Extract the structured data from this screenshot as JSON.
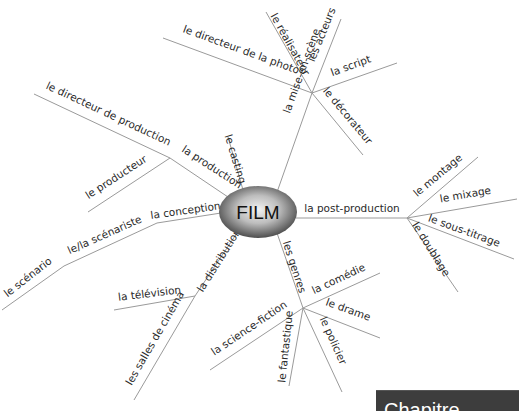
{
  "diagram": {
    "type": "mind-map",
    "center": {
      "label": "FILM"
    },
    "branches": {
      "mise_en_scene": {
        "label": "la mise-en-scène",
        "children": [
          "le directeur de la photo",
          "le réalisateur",
          "les acteurs",
          "la script",
          "le décorateur"
        ]
      },
      "casting": {
        "label": "le casting"
      },
      "production": {
        "label": "la production",
        "children": [
          "le directeur de production",
          "le producteur"
        ]
      },
      "conception": {
        "label": "la conception",
        "sub": {
          "label": "le/la scénariste",
          "sub": {
            "label": "le scénario"
          }
        }
      },
      "distribution": {
        "label": "la distribution",
        "children": [
          "la télévision",
          "les salles de cinéma"
        ]
      },
      "genres": {
        "label": "les genres",
        "children": [
          "la comédie",
          "le drame",
          "le policier",
          "le fantastique",
          "la science-fiction"
        ]
      },
      "post_production": {
        "label": "la post-production",
        "children": [
          "le montage",
          "le mixage",
          "le sous-titrage",
          "le doublage"
        ]
      }
    }
  },
  "corner_box": {
    "text": "Chapitre"
  },
  "colors": {
    "line": "#9a9a9a",
    "text": "#2a2a2a",
    "node_dark": "#3a3a3a",
    "node_light": "#e8e8e8",
    "corner_box": "#3d3d3d"
  }
}
